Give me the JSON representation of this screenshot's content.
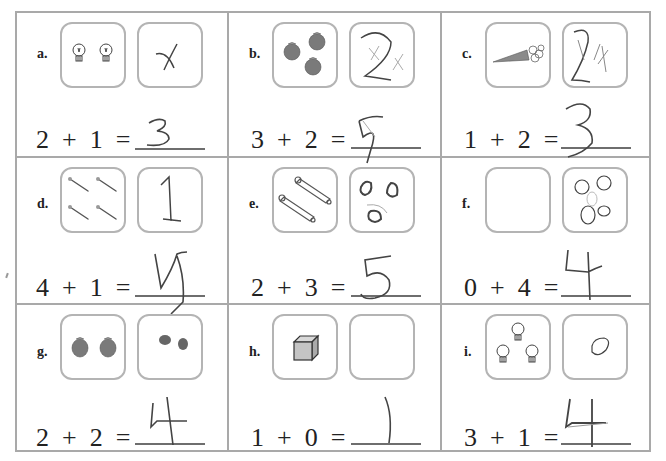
{
  "worksheet": {
    "problems": [
      {
        "label": "a.",
        "equation": "2  +  1  =",
        "addend1": 2,
        "addend2": 1,
        "picture1": "2 light bulbs",
        "picture2_drawing": "crossed-out mark",
        "written_answer": "3"
      },
      {
        "label": "b.",
        "equation": "3  +  2  =",
        "addend1": 3,
        "addend2": 2,
        "picture1": "3 apples",
        "picture2_drawing": "numeral 2 with crossed marks",
        "written_answer": "5"
      },
      {
        "label": "c.",
        "equation": "1  +  2  =",
        "addend1": 1,
        "addend2": 2,
        "picture1": "1 carrot",
        "picture2_drawing": "numeral 2 with strokes",
        "written_answer": "3"
      },
      {
        "label": "d.",
        "equation": "4  +  1  =",
        "addend1": 4,
        "addend2": 1,
        "picture1": "4 nails",
        "picture2_drawing": "numeral 1",
        "written_answer": "5"
      },
      {
        "label": "e.",
        "equation": "2  +  3  =",
        "addend1": 2,
        "addend2": 3,
        "picture1": "2 safety pins",
        "picture2_drawing": "3 circles",
        "written_answer": "5"
      },
      {
        "label": "f.",
        "equation": "0  +  4  =",
        "addend1": 0,
        "addend2": 4,
        "picture1": "empty",
        "picture2_drawing": "4 circles",
        "written_answer": "4"
      },
      {
        "label": "g.",
        "equation": "2  +  2  =",
        "addend1": 2,
        "addend2": 2,
        "picture1": "2 apples",
        "picture2_drawing": "2 scribbled dots",
        "written_answer": "4"
      },
      {
        "label": "h.",
        "equation": "1  +  0  =",
        "addend1": 1,
        "addend2": 0,
        "picture1": "1 cube",
        "picture2_drawing": "empty",
        "written_answer": "1"
      },
      {
        "label": "i.",
        "equation": "3  +  1  =",
        "addend1": 3,
        "addend2": 1,
        "picture1": "3 light bulbs",
        "picture2_drawing": "1 circle",
        "written_answer": "4"
      }
    ]
  },
  "colors": {
    "grid_border": "#a9a9a9",
    "box_border": "#b4b4b4",
    "apple": "#7a7a7a",
    "pencil": "#4a4a4a"
  }
}
